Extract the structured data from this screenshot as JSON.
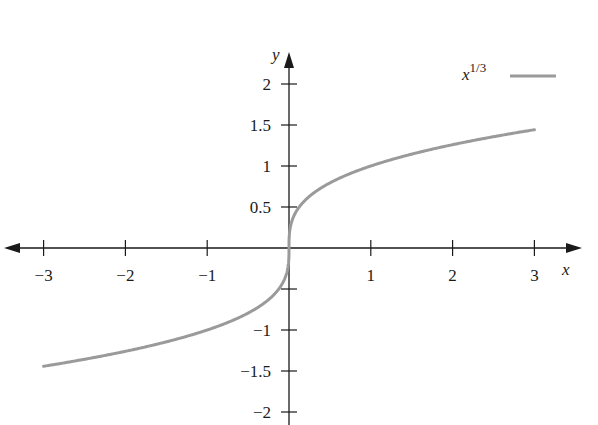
{
  "chart_data": {
    "type": "line",
    "title": "",
    "xlabel": "x",
    "ylabel": "y",
    "xlim": [
      -3,
      3
    ],
    "ylim": [
      -2,
      2
    ],
    "grid": false,
    "legend_position": "top-right",
    "x_ticks": [
      -3,
      -2,
      -1,
      1,
      2,
      3
    ],
    "x_tick_labels": [
      "−3",
      "−2",
      "−1",
      "1",
      "2",
      "3"
    ],
    "y_ticks": [
      2,
      1.5,
      1,
      0.5,
      -0.5,
      -1,
      -1.5,
      -2
    ],
    "y_tick_labels": [
      "2",
      "1.5",
      "1",
      "0.5",
      "",
      "−1",
      "−1.5",
      "−2"
    ],
    "series": [
      {
        "name": "x^(1/3)",
        "legend_base": "x",
        "legend_exponent": "1/3",
        "color": "#9a9a9a",
        "function": "cbrt",
        "x": [
          -3,
          -2,
          -1,
          -0.5,
          -0.1,
          0,
          0.1,
          0.5,
          1,
          2,
          3
        ],
        "y": [
          -1.442,
          -1.26,
          -1,
          -0.794,
          -0.464,
          0,
          0.464,
          0.794,
          1,
          1.26,
          1.442
        ]
      }
    ]
  }
}
